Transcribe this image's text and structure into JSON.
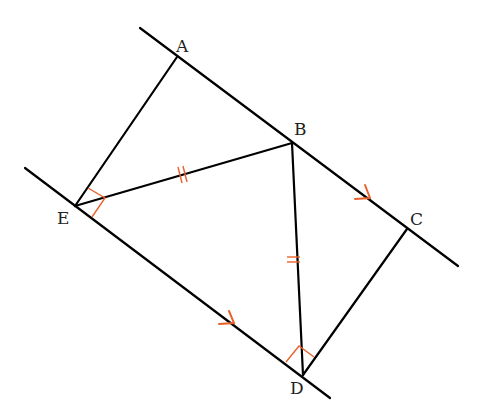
{
  "diagram": {
    "type": "geometry",
    "colors": {
      "line": "#000000",
      "mark": "#e8622c",
      "label": "#222222"
    },
    "points": {
      "A": {
        "label": "A",
        "x": 177,
        "y": 57
      },
      "B": {
        "label": "B",
        "x": 292,
        "y": 143
      },
      "C": {
        "label": "C",
        "x": 407,
        "y": 229
      },
      "D": {
        "label": "D",
        "x": 303,
        "y": 375
      },
      "E": {
        "label": "E",
        "x": 75,
        "y": 206
      }
    },
    "lines": [
      {
        "name": "line-ABC",
        "from": [
          140,
          28
        ],
        "to": [
          458,
          266
        ]
      },
      {
        "name": "line-ED",
        "from": [
          25,
          168
        ],
        "to": [
          330,
          398
        ]
      }
    ],
    "segments": [
      "AE",
      "EB",
      "BD",
      "DC"
    ],
    "marks": {
      "right_angle_E": "AEB",
      "right_angle_D": "BDC",
      "equal_ticks": [
        "EB",
        "BD"
      ],
      "parallel_arrows": [
        "BC",
        "ED"
      ]
    }
  }
}
